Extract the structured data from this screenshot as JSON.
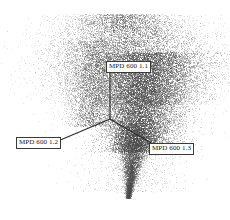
{
  "figure": {
    "width": 230,
    "height": 220,
    "background": "#ffffff"
  },
  "chart_data": {
    "type": "scatter",
    "title": "",
    "subtitle": "",
    "xlabel": "",
    "ylabel": "",
    "projection": "3d-triaxial",
    "grid": false,
    "legend": null,
    "point_color": "#4a4a4a",
    "axis_color": "#2b2b2b",
    "origin": {
      "x": 110,
      "y": 119
    },
    "axes": [
      {
        "id": "axis1",
        "label": "MPD 600 1.1",
        "direction": "up",
        "line": {
          "x1": 110,
          "y1": 119,
          "x2": 110,
          "y2": 72
        },
        "label_position": {
          "x": 106,
          "y": 61
        }
      },
      {
        "id": "axis2",
        "label": "MPD 600 1.2",
        "direction": "down-left",
        "line": {
          "x1": 110,
          "y1": 119,
          "x2": 58,
          "y2": 141
        },
        "label_position": {
          "x": 16,
          "y": 137
        }
      },
      {
        "id": "axis3",
        "label": "MPD 600 1.3",
        "direction": "down-right",
        "line": {
          "x1": 110,
          "y1": 119,
          "x2": 158,
          "y2": 147
        },
        "label_position": {
          "x": 149,
          "y": 143
        }
      }
    ],
    "cloud": {
      "description": "dense grayscale point cloud, broad diffuse fan across the upper region narrowing to a long tapering tail at the bottom",
      "x_extent": [
        40,
        198
      ],
      "y_extent": [
        14,
        198
      ],
      "density_peak": {
        "x": 150,
        "y": 105
      },
      "total_points": 26000
    }
  },
  "labels": {
    "axis1": "MPD 600 1.1",
    "axis2": "MPD 600 1.2",
    "axis3": "MPD 600 1.3"
  }
}
